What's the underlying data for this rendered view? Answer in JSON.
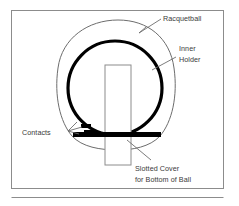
{
  "figure": {
    "background_color": "#ffffff",
    "frame_color": "#8c8c8c",
    "line_color": "#6d6d6d",
    "solid_color": "#000000",
    "text_color": "#3a3a3a"
  },
  "labels": {
    "racquetball": "Racquetball",
    "inner_holder_line1": "Inner",
    "inner_holder_line2": "Holder",
    "contacts": "Contacts",
    "slotted_cover_line1": "Slotted Cover",
    "slotted_cover_line2": "for Bottom of Ball"
  },
  "parts": [
    {
      "name": "racquetball",
      "label": "Racquetball",
      "shape": "egg-outline",
      "style": "thin-outline"
    },
    {
      "name": "inner-holder",
      "label": "Inner Holder",
      "shape": "circle",
      "style": "thick-outline"
    },
    {
      "name": "contacts",
      "label": "Contacts",
      "shape": "two-stepped-pads",
      "style": "filled-black"
    },
    {
      "name": "slotted-cover",
      "label": "Slotted Cover for Bottom of Ball",
      "shape": "horizontal-bar-with-vertical-slot",
      "style": "filled-black"
    }
  ]
}
